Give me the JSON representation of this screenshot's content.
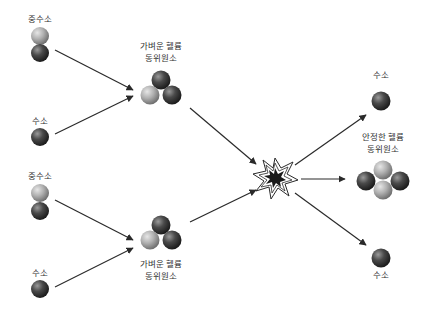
{
  "diagram": {
    "colors": {
      "proton": "#3a3a3a",
      "neutron": "#a8a8a8",
      "arrow": "#2a2a2a",
      "text": "#333333",
      "burst_fill": "#1a1a1a"
    },
    "inputs_top": {
      "deuterium_label": "중수소",
      "hydrogen_label": "수소"
    },
    "inputs_bottom": {
      "deuterium_label": "중수소",
      "hydrogen_label": "수소"
    },
    "intermediate_top": {
      "label_line1": "가벼운 헬륨",
      "label_line2": "동위원소"
    },
    "intermediate_bottom": {
      "label_line1": "가벼운 헬륨",
      "label_line2": "동위원소"
    },
    "outputs": {
      "hydrogen_top_label": "수소",
      "helium_label_line1": "안정한 헬륨",
      "helium_label_line2": "동위원소",
      "hydrogen_bottom_label": "수소"
    }
  }
}
